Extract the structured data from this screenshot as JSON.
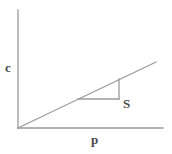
{
  "figure": {
    "title": "",
    "background_color": "#ffffff",
    "line_color": "#9a9a9a",
    "label_color": "#4a4a4a"
  },
  "axes": {
    "y_axis": {
      "label": "c",
      "name": "concentration-axis",
      "x": 18,
      "y_top": 10,
      "y_bottom": 128
    },
    "x_axis": {
      "label": "p",
      "name": "pressure-axis",
      "y": 128,
      "x_left": 18,
      "x_right": 163
    }
  },
  "annotations": {
    "slope_label": "S"
  },
  "chart_data": {
    "type": "line",
    "title": "",
    "xlabel": "p",
    "ylabel": "c",
    "grid": false,
    "legend": null,
    "series": [
      {
        "name": "linear-relation",
        "points": [
          {
            "x": 0,
            "y": 0
          },
          {
            "x": 1,
            "y": 1
          }
        ],
        "pixel_start": {
          "x": 18,
          "y": 128
        },
        "pixel_end": {
          "x": 156,
          "y": 62
        },
        "slope_label": "S"
      }
    ],
    "slope_triangle": {
      "label": "S",
      "run_start": {
        "x": 78,
        "y": 99
      },
      "run_end": {
        "x": 119,
        "y": 99
      },
      "rise_top": {
        "x": 119,
        "y": 79
      },
      "rise_bottom": {
        "x": 119,
        "y": 99
      }
    }
  }
}
